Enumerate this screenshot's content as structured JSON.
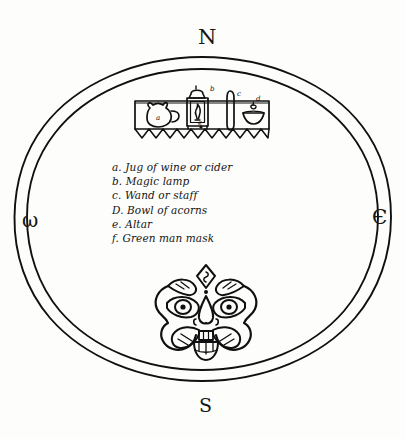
{
  "diagram": {
    "title_visible": false,
    "style": "hand-drawn ink sketch",
    "ink_color": "#101010",
    "paper_color": "#fdfdfb"
  },
  "compass": {
    "north": "N",
    "east": "Є",
    "south": "S",
    "west": "ω"
  },
  "circle": {
    "rings": 2,
    "outer_label": "outer-ring",
    "inner_label": "inner-ring"
  },
  "legend": {
    "items": [
      {
        "key": "a.",
        "text": "Jug of wine or cider"
      },
      {
        "key": "b.",
        "text": "Magic lamp"
      },
      {
        "key": "c.",
        "text": "Wand  or  staff"
      },
      {
        "key": "D.",
        "text": "Bowl  of  acorns"
      },
      {
        "key": "e.",
        "text": "Altar"
      },
      {
        "key": "f.",
        "text": "Green man  mask"
      }
    ]
  },
  "altar": {
    "marker": "e",
    "items": [
      {
        "marker": "a",
        "name": "jug"
      },
      {
        "marker": "b",
        "name": "lamp"
      },
      {
        "marker": "c",
        "name": "wand"
      },
      {
        "marker": "d",
        "name": "bowl"
      }
    ]
  },
  "mask": {
    "marker": "f",
    "name": "green-man-mask"
  }
}
